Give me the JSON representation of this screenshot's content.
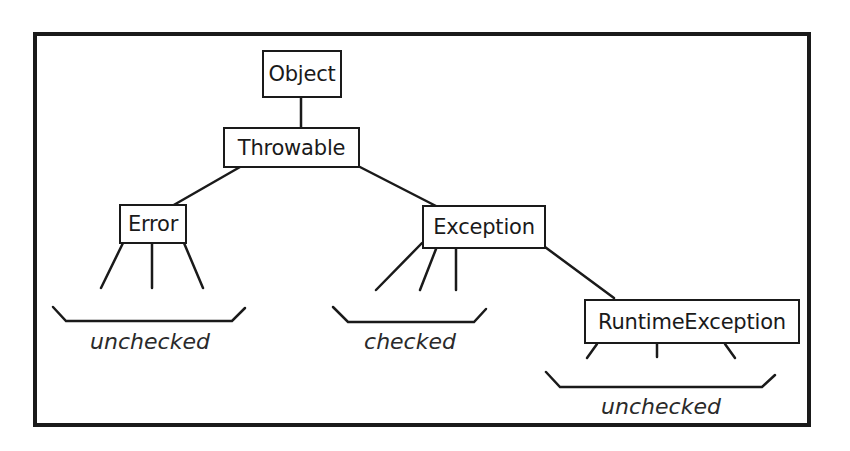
{
  "diagram": {
    "nodes": {
      "object": "Object",
      "throwable": "Throwable",
      "error": "Error",
      "exception": "Exception",
      "runtime_exception": "RuntimeException"
    },
    "groups": {
      "error_group": "unchecked",
      "exception_group": "checked",
      "runtime_group": "unchecked"
    },
    "edges": [
      [
        "Object",
        "Throwable"
      ],
      [
        "Throwable",
        "Error"
      ],
      [
        "Throwable",
        "Exception"
      ],
      [
        "Exception",
        "RuntimeException"
      ]
    ],
    "colors": {
      "stroke": "#1a1a1a",
      "background": "#ffffff"
    }
  }
}
